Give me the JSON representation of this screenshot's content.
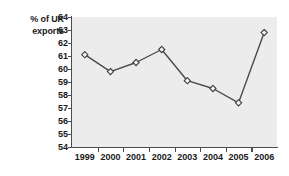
{
  "chart_data": {
    "type": "line",
    "title": "",
    "subtitle": "",
    "ylabel": "% of UK\nexports",
    "xlabel": "",
    "categories": [
      "1999",
      "2000",
      "2001",
      "2002",
      "2003",
      "2004",
      "2005",
      "2006"
    ],
    "values": [
      61.1,
      59.8,
      60.5,
      61.5,
      59.1,
      58.5,
      57.4,
      62.8
    ],
    "series": [
      {
        "name": "% of UK exports",
        "values": [
          61.1,
          59.8,
          60.5,
          61.5,
          59.1,
          58.5,
          57.4,
          62.8
        ]
      }
    ],
    "ylim": [
      54,
      64
    ],
    "y_ticks": [
      64,
      63,
      62,
      61,
      60,
      59,
      58,
      57,
      56,
      55,
      54
    ],
    "x_ticks": [
      "1999",
      "2000",
      "2001",
      "2002",
      "2003",
      "2004",
      "2005",
      "2006"
    ],
    "grid": false,
    "legend": null,
    "legend_position": "none",
    "marker": "diamond",
    "colors": {
      "plot_background": "#ececec",
      "page_background": "#ffffff",
      "axis": "#4d4d4d",
      "line": "#4a4a4a",
      "marker_fill": "#f4f4f4",
      "marker_stroke": "#3d3d3d",
      "text": "#1a1a1a"
    }
  }
}
